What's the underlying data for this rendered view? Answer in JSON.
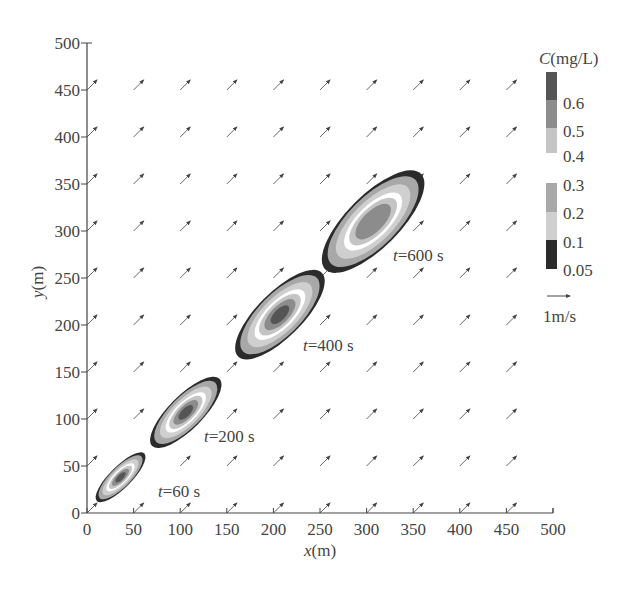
{
  "chart_data": {
    "type": "contour",
    "title": "",
    "xlabel": "x(m)",
    "ylabel": "y(m)",
    "xlim": [
      0,
      500
    ],
    "ylim": [
      0,
      500
    ],
    "xticks": [
      0,
      50,
      100,
      150,
      200,
      250,
      300,
      350,
      400,
      450,
      500
    ],
    "yticks": [
      0,
      50,
      100,
      150,
      200,
      250,
      300,
      350,
      400,
      450,
      500
    ],
    "grid": false,
    "velocity_field": {
      "direction_deg": 45,
      "grid_x": [
        0,
        50,
        100,
        150,
        200,
        250,
        300,
        350,
        400,
        450
      ],
      "grid_y": [
        0,
        50,
        100,
        150,
        200,
        250,
        300,
        350,
        400,
        450
      ],
      "reference_arrow_label": "1m/s"
    },
    "colorbar": {
      "title": "C(mg/L)",
      "levels": [
        0.05,
        0.1,
        0.2,
        0.3,
        0.4,
        0.5,
        0.6
      ],
      "upper_segment": {
        "labels": [
          "0.6",
          "0.5",
          "0.4"
        ],
        "colors": [
          "#555555",
          "#8c8c8c",
          "#c4c4c4"
        ]
      },
      "lower_segment": {
        "labels": [
          "0.3",
          "0.2",
          "0.1",
          "0.05"
        ],
        "colors": [
          "#a8a8a8",
          "#cfcfcf",
          "#2b2b2b"
        ]
      }
    },
    "plumes": [
      {
        "label": "t=60 s",
        "time_s": 60,
        "center_x": 36,
        "center_y": 38,
        "length_m": 72,
        "width_m": 23,
        "max_level": 0.6
      },
      {
        "label": "t=200 s",
        "time_s": 200,
        "center_x": 106,
        "center_y": 107,
        "length_m": 102,
        "width_m": 36,
        "max_level": 0.6
      },
      {
        "label": "t=400 s",
        "time_s": 400,
        "center_x": 207,
        "center_y": 211,
        "length_m": 127,
        "width_m": 48,
        "max_level": 0.6
      },
      {
        "label": "t=600 s",
        "time_s": 600,
        "center_x": 307,
        "center_y": 310,
        "length_m": 145,
        "width_m": 56,
        "max_level": 0.5
      }
    ]
  },
  "labels": {
    "xlabel": "x(m)",
    "ylabel": "y(m)",
    "cb_title": "C(mg/L)",
    "ref": "1m/s",
    "xticks": [
      "0",
      "50",
      "100",
      "150",
      "200",
      "250",
      "300",
      "350",
      "400",
      "450",
      "500"
    ],
    "yticks": [
      "0",
      "50",
      "100",
      "150",
      "200",
      "250",
      "300",
      "350",
      "400",
      "450",
      "500"
    ]
  }
}
